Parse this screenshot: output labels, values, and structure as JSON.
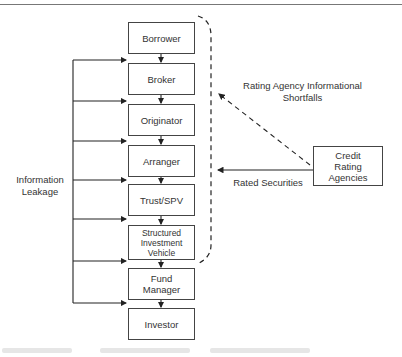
{
  "diagram": {
    "chain": [
      {
        "id": "borrower",
        "label": "Borrower"
      },
      {
        "id": "broker",
        "label": "Broker"
      },
      {
        "id": "originator",
        "label": "Originator"
      },
      {
        "id": "arranger",
        "label": "Arranger"
      },
      {
        "id": "trust-spv",
        "label": "Trust/SPV"
      },
      {
        "id": "siv",
        "label": "Structured\nInvestment\nVehicle"
      },
      {
        "id": "fund-manager",
        "label": "Fund\nManager"
      },
      {
        "id": "investor",
        "label": "Investor"
      }
    ],
    "external": {
      "id": "credit-rating-agencies",
      "label": "Credit\nRating\nAgencies"
    },
    "labels": {
      "information_leakage": "Information\nLeakage",
      "rating_shortfalls": "Rating Agency Informational\nShortfalls",
      "rated_securities": "Rated Securities"
    },
    "colors": {
      "line": "#333333",
      "box_border": "#444444",
      "text": "#333333"
    }
  }
}
